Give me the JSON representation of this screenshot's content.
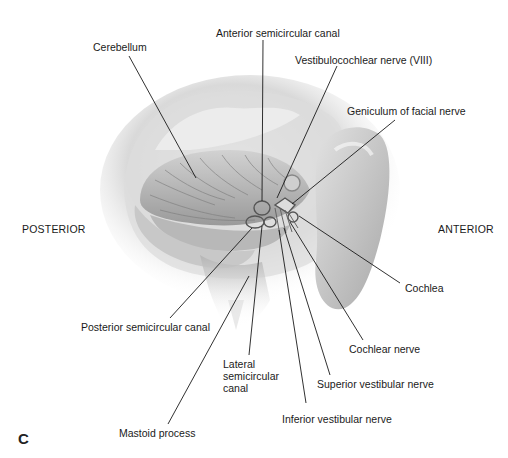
{
  "figure": {
    "panel_letter": "C",
    "orientation": {
      "left": "POSTERIOR",
      "right": "ANTERIOR"
    },
    "labels": {
      "cerebellum": "Cerebellum",
      "anterior_semicircular_canal": "Anterior semicircular canal",
      "vestibulocochlear_nerve": "Vestibulocochlear nerve (VIII)",
      "geniculum_facial_nerve": "Geniculum of facial nerve",
      "cochlea": "Cochlea",
      "cochlear_nerve": "Cochlear nerve",
      "superior_vestibular_nerve": "Superior vestibular nerve",
      "inferior_vestibular_nerve": "Inferior vestibular nerve",
      "lateral_semicircular_canal": "Lateral\nsemicircular\ncanal",
      "posterior_semicircular_canal": "Posterior semicircular canal",
      "mastoid_process": "Mastoid process"
    },
    "colors": {
      "background": "#ffffff",
      "text": "#1a1a1a",
      "leader_line": "#1a1a1a",
      "illustration_light": "#e6e6e6",
      "illustration_dark": "#8a8a8a"
    }
  }
}
